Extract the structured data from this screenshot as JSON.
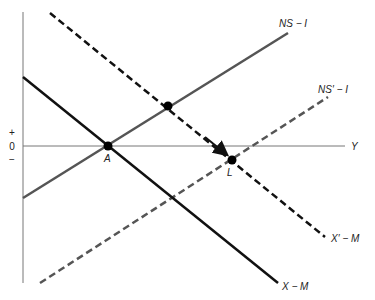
{
  "diagram": {
    "type": "economics-line-diagram",
    "axes": {
      "x_label": "Y",
      "y_ticks": [
        "+",
        "0",
        "−"
      ]
    },
    "curves": [
      {
        "id": "x-m",
        "label": "X − M",
        "style": "solid",
        "color": "#111111",
        "slope": "negative"
      },
      {
        "id": "x-prime-m",
        "label": "X′ − M",
        "style": "dashed",
        "color": "#111111",
        "slope": "negative"
      },
      {
        "id": "ns-i",
        "label": "NS − I",
        "style": "solid",
        "color": "#555555",
        "slope": "positive"
      },
      {
        "id": "ns-prime-i",
        "label": "NS′ − I",
        "style": "dashed",
        "color": "#555555",
        "slope": "positive"
      }
    ],
    "points": [
      {
        "id": "A",
        "label": "A",
        "on": [
          "x-m",
          "ns-i"
        ]
      },
      {
        "id": "L",
        "label": "L",
        "on": [
          "x-prime-m",
          "ns-prime-i"
        ]
      },
      {
        "id": "upper",
        "label": "",
        "on": [
          "x-prime-m",
          "ns-i"
        ]
      }
    ],
    "arrow": {
      "from": "upper",
      "to": "L",
      "along": "x-prime-m"
    }
  }
}
